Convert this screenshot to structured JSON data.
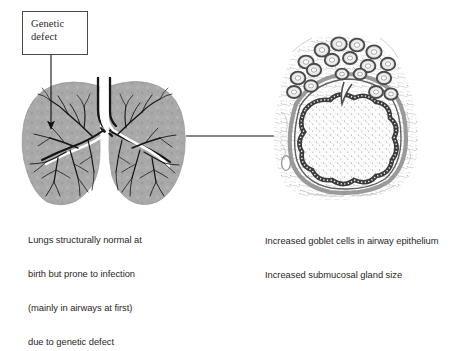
{
  "figure": {
    "background_color": "#ffffff"
  },
  "callout": {
    "label_line_1": "Genetic",
    "label_line_2": "defect",
    "border_color": "#4a4a4a",
    "fill_color": "#ffffff"
  },
  "arrows": {
    "defect_to_lung": {
      "name": "vertical-arrow",
      "direction": "down",
      "from": [
        51,
        55
      ],
      "to": [
        51,
        130
      ]
    },
    "lung_to_histology": {
      "name": "horizontal-arrow",
      "direction": "right",
      "from": [
        186,
        136
      ],
      "to": [
        288,
        136
      ]
    }
  },
  "left_panel": {
    "name": "lung-diagram",
    "kind": "illustration-lungs-bronchial-tree",
    "parenchyma_color": "#a9a9a9",
    "airway_outline_color": "#1a1a1a",
    "airway_lumen_color": "#ffffff",
    "caption_lines": [
      "Lungs structurally normal at",
      "birth but prone to infection",
      "(mainly in airways at first)",
      "due to genetic defect"
    ]
  },
  "right_panel": {
    "name": "airway-histology",
    "kind": "micrograph-airway-cross-section",
    "stain_tone": "#6f6f6f",
    "lumen_color": "#fbfbfb",
    "features": [
      "goblet-cell-epithelium",
      "submucosal-glands",
      "smooth-muscle-layer",
      "mucus-in-lumen"
    ],
    "caption_lines": [
      "Increased goblet cells in airway epithelium",
      "Increased submucosal gland size"
    ]
  },
  "colors": {
    "ink": "#231f20",
    "gray_tissue": "#a9a9a9",
    "dark_outline": "#1a1a1a"
  }
}
